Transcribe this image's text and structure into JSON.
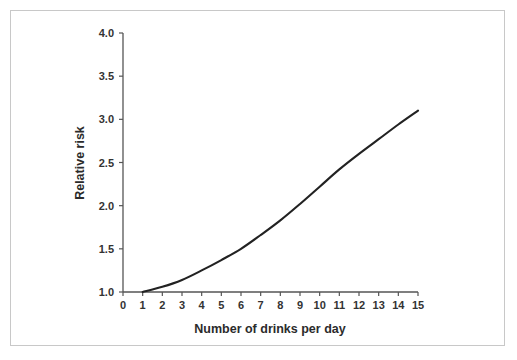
{
  "figure": {
    "background_color": "#ffffff",
    "border_color": "#c8c8c8",
    "axis_color": "#555555",
    "line_color": "#222222"
  },
  "chart_data": {
    "type": "line",
    "title": "",
    "subtitle": "",
    "xlabel": "Number of drinks per day",
    "ylabel": "Relative risk",
    "xlim": [
      0,
      15
    ],
    "ylim": [
      1.0,
      4.0
    ],
    "grid": false,
    "legend": null,
    "legend_position": "none",
    "xticks": [
      0,
      1,
      2,
      3,
      4,
      5,
      6,
      7,
      8,
      9,
      10,
      11,
      12,
      13,
      14,
      15
    ],
    "xtick_labels": [
      "0",
      "1",
      "2",
      "3",
      "4",
      "5",
      "6",
      "7",
      "8",
      "9",
      "10",
      "11",
      "12",
      "13",
      "14",
      "15"
    ],
    "yticks": [
      1.0,
      1.5,
      2.0,
      2.5,
      3.0,
      3.5,
      4.0
    ],
    "ytick_labels": [
      "1.0",
      "1.5",
      "2.0",
      "2.5",
      "3.0",
      "3.5",
      "4.0"
    ],
    "series": [
      {
        "name": "Relative risk",
        "color": "#222222",
        "x": [
          1,
          2,
          3,
          4,
          5,
          6,
          7,
          8,
          9,
          10,
          11,
          12,
          13,
          14,
          15
        ],
        "values": [
          1.0,
          1.06,
          1.14,
          1.25,
          1.37,
          1.5,
          1.66,
          1.83,
          2.02,
          2.22,
          2.42,
          2.6,
          2.77,
          2.94,
          3.1
        ]
      }
    ],
    "annotations": []
  }
}
